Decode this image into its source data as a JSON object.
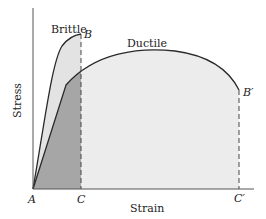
{
  "diagram": {
    "axes": {
      "x_label": "Strain",
      "y_label": "Stress"
    },
    "curves": [
      {
        "name": "Brittle",
        "end_point": "B"
      },
      {
        "name": "Ductile",
        "end_point": "B′"
      }
    ],
    "points": {
      "origin": "A",
      "brittle_end": "B",
      "brittle_strain": "C",
      "ductile_end": "B′",
      "ductile_strain": "C′"
    },
    "colors": {
      "brittle_fill": "#e6e6e6",
      "ductile_fill": "#ececec",
      "overlap_fill": "#a6a6a6",
      "line": "#2a2a2a",
      "axis": "#555555"
    }
  }
}
